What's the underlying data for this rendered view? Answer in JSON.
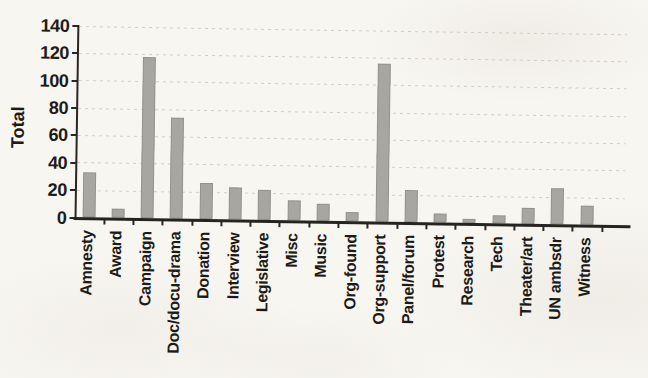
{
  "figure": {
    "background_color": "#f8f6f1",
    "bar_color": "#a8a6a1",
    "axis_color": "#2a2723",
    "text_color": "#1d1b18",
    "gridline_color": "#c6c2b8"
  },
  "chart_data": {
    "type": "bar",
    "title": "",
    "xlabel": "",
    "ylabel": "Total",
    "ylim": [
      0,
      140
    ],
    "yticks": [
      0,
      20,
      40,
      60,
      80,
      100,
      120,
      140
    ],
    "grid": "horizontal dotted gridlines at each y tick",
    "legend_position": "none",
    "x_tick_label_rotation": 90,
    "categories": [
      "Amnesty",
      "Award",
      "Campaign",
      "Doc/docu-drama",
      "Donation",
      "Interview",
      "Legislative",
      "Misc",
      "Music",
      "Org-found",
      "Org-support",
      "Panel/forum",
      "Protest",
      "Research",
      "Tech",
      "Theater/art",
      "UN ambsdr",
      "Witness"
    ],
    "values": [
      33,
      7,
      118,
      74,
      27,
      24,
      22,
      15,
      13,
      7,
      116,
      24,
      7,
      3,
      6,
      12,
      27,
      14
    ]
  }
}
